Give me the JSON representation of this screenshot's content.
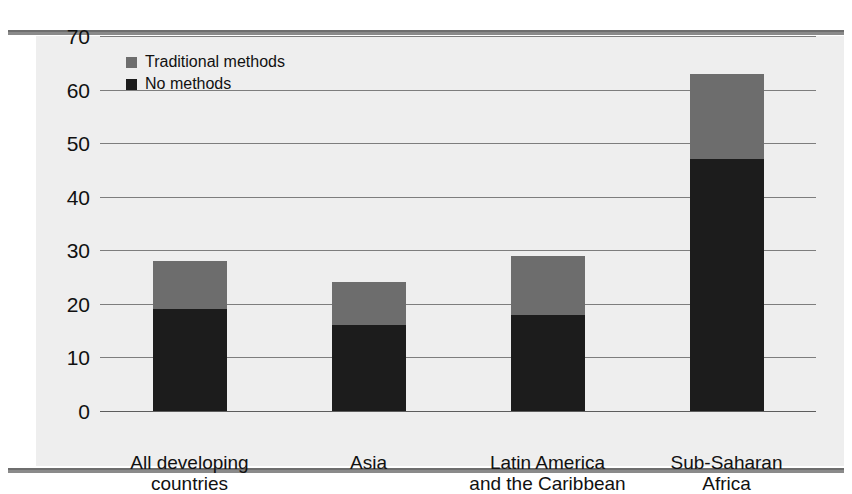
{
  "chart_data": {
    "type": "bar",
    "stacked": true,
    "title": "",
    "subtitle": "",
    "xlabel": "",
    "ylabel": "",
    "ylim": [
      0,
      70
    ],
    "yticks": [
      0,
      10,
      20,
      30,
      40,
      50,
      60,
      70
    ],
    "ytick_labels": [
      "0",
      "10",
      "20",
      "30",
      "40",
      "50",
      "60",
      "70"
    ],
    "grid": true,
    "legend_position": "top-left",
    "categories": [
      "All developing\ncountries",
      "Asia",
      "Latin America\nand the Caribbean",
      "Sub-Saharan\nAfrica"
    ],
    "category_lines": [
      [
        "All developing",
        "countries"
      ],
      [
        "Asia",
        ""
      ],
      [
        "Latin America",
        "and the Caribbean"
      ],
      [
        "Sub-Saharan",
        "Africa"
      ]
    ],
    "series": [
      {
        "name": "No methods",
        "color": "#1c1c1c",
        "values": [
          19,
          16,
          18,
          47
        ]
      },
      {
        "name": "Traditional methods",
        "color": "#6d6d6d",
        "values": [
          9,
          8,
          11,
          16
        ]
      }
    ],
    "totals": [
      28,
      24,
      29,
      63
    ]
  },
  "legend": {
    "entries": [
      {
        "label": "Traditional methods",
        "color": "#6d6d6d"
      },
      {
        "label": "No methods",
        "color": "#1c1c1c"
      }
    ]
  },
  "colors": {
    "traditional": "#6d6d6d",
    "no_methods": "#1c1c1c",
    "canvas": "#eeeeee",
    "gridline": "#7d7d7d",
    "rule": "#8a8a8a"
  }
}
